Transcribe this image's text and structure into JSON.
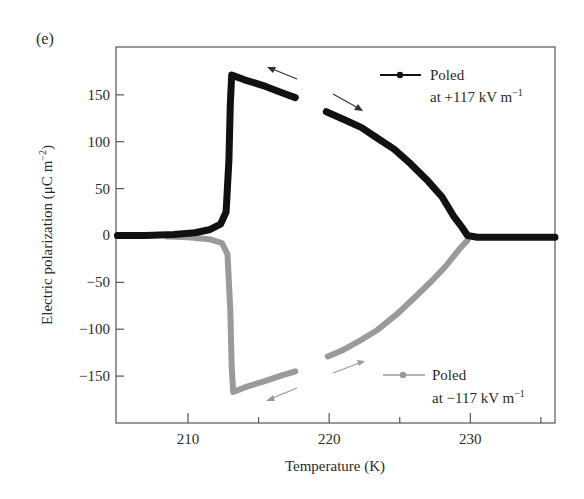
{
  "chart_data": {
    "type": "line",
    "panel_label": "(e)",
    "title": "",
    "xlabel": "Temperature (K)",
    "ylabel": "Electric polarization (μC m⁻²)",
    "xlim": [
      204.9,
      236
    ],
    "ylim": [
      -200,
      201
    ],
    "x_ticks": [
      210,
      220,
      230
    ],
    "x_minor_ticks": [
      215,
      225,
      235
    ],
    "x_tick_labels": [
      "210",
      "220",
      "230"
    ],
    "y_ticks": [
      150,
      100,
      50,
      0,
      -50,
      -100,
      -150
    ],
    "y_tick_labels": [
      "150",
      "100",
      "50",
      "0",
      "−50",
      "−100",
      "−150"
    ],
    "grid": false,
    "series": [
      {
        "name": "Poled at +117 kV m⁻¹",
        "color": "#111111",
        "segments": [
          {
            "direction": "cooling (leftward arrow)",
            "x": [
              205.0,
              207.0,
              209.0,
              210.5,
              211.5,
              212.3,
              212.7,
              212.9,
              213.0,
              213.1,
              214.0,
              215.5,
              216.7,
              217.6
            ],
            "y": [
              0,
              0,
              1,
              3,
              6,
              12,
              25,
              80,
              140,
              171,
              166,
              159,
              152,
              147
            ]
          },
          {
            "direction": "heating (rightward arrow)",
            "x": [
              219.8,
              221.0,
              222.3,
              223.4,
              224.6,
              225.8,
              227.0,
              228.0,
              228.8,
              229.4,
              229.8,
              230.5,
              232.0,
              234.0,
              236.0
            ],
            "y": [
              132,
              124,
              115,
              104,
              92,
              76,
              58,
              41,
              21,
              9,
              0,
              -2,
              -2,
              -2,
              -2
            ]
          }
        ]
      },
      {
        "name": "Poled at −117 kV m⁻¹",
        "color": "#9a9a9a",
        "segments": [
          {
            "direction": "cooling (leftward arrow)",
            "x": [
              208.5,
              210.0,
              211.5,
              212.4,
              212.8,
              213.0,
              213.1,
              213.2,
              214.0,
              215.5,
              216.7,
              217.6
            ],
            "y": [
              -1,
              -2,
              -4,
              -8,
              -20,
              -80,
              -140,
              -167,
              -162,
              -155,
              -149,
              -145
            ]
          },
          {
            "direction": "heating (rightward arrow)",
            "x": [
              219.9,
              221.0,
              222.2,
              223.4,
              224.8,
              226.2,
              227.3,
              228.3,
              229.2,
              229.8
            ],
            "y": [
              -129,
              -122,
              -112,
              -101,
              -84,
              -64,
              -48,
              -32,
              -15,
              -5
            ]
          }
        ]
      }
    ],
    "legend": [
      {
        "label_line1": "Poled",
        "label_line2": "at +117 kV m",
        "superscript": "−1",
        "color": "#111111"
      },
      {
        "label_line1": "Poled",
        "label_line2": "at −117 kV m",
        "superscript": "−1",
        "color": "#9a9a9a"
      }
    ],
    "legend_position": "right, upper (black) and lower (gray)"
  }
}
